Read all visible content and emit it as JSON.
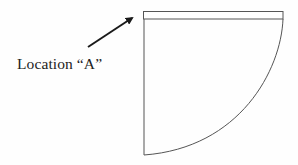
{
  "diagram": {
    "label": "Location “A”",
    "colors": {
      "stroke": "#555555",
      "arrow": "#1a1a1a",
      "text": "#222222",
      "background": "#fefefe"
    },
    "shape": {
      "type": "quarter-circle-sector-with-top-band",
      "top_band": {
        "x1": 143,
        "x2": 283,
        "y_top": 11,
        "y_inner": 19
      },
      "left_edge": {
        "x": 144,
        "y_top": 11,
        "y_bottom": 155
      },
      "arc": {
        "start": [
          283,
          19
        ],
        "end": [
          144,
          155
        ]
      }
    },
    "arrow": {
      "from": [
        88,
        47
      ],
      "to": [
        134,
        16
      ],
      "points_to": "Location A"
    }
  }
}
